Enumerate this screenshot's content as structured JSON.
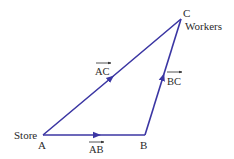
{
  "diagram": {
    "type": "vector-triangle",
    "line_color": "#3b36a3",
    "text_color": "#2a2a2a",
    "points": {
      "A": {
        "label": "A",
        "name": "Store",
        "x": 43,
        "y": 135
      },
      "B": {
        "label": "B",
        "x": 145,
        "y": 135
      },
      "C": {
        "label": "C",
        "name": "Workers",
        "x": 181,
        "y": 19
      }
    },
    "vectors": [
      {
        "id": "AB",
        "label": "AB",
        "from": "A",
        "to": "B"
      },
      {
        "id": "BC",
        "label": "BC",
        "from": "B",
        "to": "C"
      },
      {
        "id": "AC",
        "label": "AC",
        "from": "A",
        "to": "C"
      }
    ]
  }
}
